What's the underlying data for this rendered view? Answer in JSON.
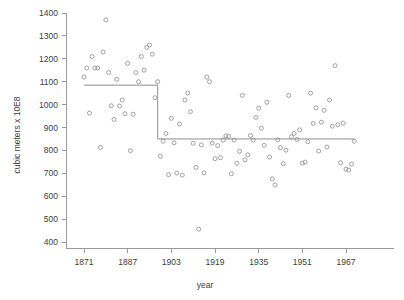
{
  "chart_data": {
    "type": "scatter",
    "title": "",
    "subtitle": "",
    "xlabel": "year",
    "ylabel": "cubic meters x 10E8",
    "xlim": [
      1869,
      1972
    ],
    "ylim": [
      400,
      1400
    ],
    "grid": false,
    "legend": "none",
    "x_ticks": [
      1871,
      1887,
      1903,
      1919,
      1935,
      1951,
      1967
    ],
    "x_tick_labels": [
      "1871",
      "1887",
      "1903",
      "1919",
      "1935",
      "1951",
      "1967"
    ],
    "y_ticks": [
      400,
      500,
      600,
      700,
      800,
      900,
      1000,
      1100,
      1200,
      1300,
      1400
    ],
    "y_tick_labels": [
      "400",
      "500",
      "600",
      "700",
      "800",
      "900",
      "1000",
      "1100",
      "1200",
      "1300",
      "1400"
    ],
    "marker": "open-circle",
    "marker_color": "#8a8a8a",
    "line_color": "#8e8e8e",
    "x": [
      1871,
      1872,
      1873,
      1874,
      1875,
      1876,
      1877,
      1878,
      1879,
      1880,
      1881,
      1882,
      1883,
      1884,
      1885,
      1886,
      1887,
      1888,
      1889,
      1890,
      1891,
      1892,
      1893,
      1894,
      1895,
      1896,
      1897,
      1898,
      1899,
      1900,
      1901,
      1902,
      1903,
      1904,
      1905,
      1906,
      1907,
      1908,
      1909,
      1910,
      1911,
      1912,
      1913,
      1914,
      1915,
      1916,
      1917,
      1918,
      1919,
      1920,
      1921,
      1922,
      1923,
      1924,
      1925,
      1926,
      1927,
      1928,
      1929,
      1930,
      1931,
      1932,
      1933,
      1934,
      1935,
      1936,
      1937,
      1938,
      1939,
      1940,
      1941,
      1942,
      1943,
      1944,
      1945,
      1946,
      1947,
      1948,
      1949,
      1950,
      1951,
      1952,
      1953,
      1954,
      1955,
      1956,
      1957,
      1958,
      1959,
      1960,
      1961,
      1962,
      1963,
      1964,
      1965,
      1966,
      1967,
      1968,
      1969,
      1970
    ],
    "values": [
      1120,
      1160,
      963,
      1210,
      1160,
      1160,
      813,
      1230,
      1370,
      1140,
      995,
      935,
      1110,
      994,
      1020,
      960,
      1180,
      799,
      958,
      1140,
      1100,
      1210,
      1150,
      1250,
      1260,
      1220,
      1030,
      1100,
      774,
      840,
      874,
      694,
      940,
      833,
      701,
      916,
      692,
      1020,
      1050,
      969,
      831,
      726,
      456,
      824,
      702,
      1120,
      1100,
      832,
      764,
      821,
      768,
      845,
      864,
      862,
      698,
      845,
      744,
      796,
      1040,
      759,
      781,
      865,
      845,
      944,
      984,
      897,
      822,
      1010,
      771,
      676,
      649,
      846,
      812,
      742,
      801,
      1040,
      860,
      874,
      848,
      890,
      744,
      749,
      838,
      1050,
      918,
      986,
      797,
      923,
      975,
      815,
      1020,
      906,
      1170,
      912,
      746,
      919,
      718,
      714,
      740,
      840
    ],
    "fit": {
      "type": "step",
      "name": "changepoint-fit",
      "changepoint_year": 1898,
      "level_before": 1085,
      "level_after": 850,
      "x_start": 1871,
      "x_end": 1970
    }
  },
  "axes": {
    "y_axis_title": "cubic meters x 10E8",
    "x_axis_title": "year"
  }
}
